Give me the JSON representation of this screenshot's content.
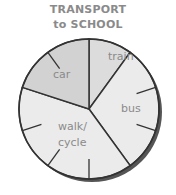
{
  "title_line1": "TRANSPORT",
  "title_line2": "to SCHOOL",
  "chart_data": {
    "type": "pie",
    "categories": [
      "train",
      "bus",
      "walk/cycle",
      "car"
    ],
    "values": [
      10,
      30,
      40,
      20
    ],
    "unit": "percent (tenths of circle)",
    "start_angle_deg": 0,
    "direction": "clockwise",
    "tick_divisions": 10,
    "legend": "none (labels inside slices)",
    "colors": {
      "train": "#dcdcdc",
      "bus": "#ebebeb",
      "walk/cycle": "#ebebeb",
      "car": "#d2d2d2"
    }
  },
  "labels": {
    "train": "train",
    "bus": "bus",
    "walk": "walk/",
    "cycle": "cycle",
    "car": "car"
  }
}
